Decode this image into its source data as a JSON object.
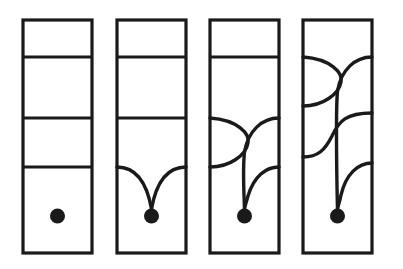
{
  "figure": {
    "background_color": "#ffffff",
    "ink_color": "#1a1a1a",
    "canvas": {
      "width": 403,
      "height": 269
    },
    "panel_count": 4,
    "panel_geometry": {
      "x_starts": [
        23,
        117,
        210,
        303
      ],
      "width": 69,
      "top": 20,
      "bottom": 253,
      "frame_stroke_width": 3.2
    },
    "levels": {
      "count": 3,
      "y_values": [
        57,
        118,
        167
      ],
      "labels": [
        "level-1",
        "level-2",
        "level-3"
      ],
      "stroke_width": 3.2
    },
    "marker": {
      "name": "basepoint-dot",
      "radius": 7.5,
      "y": 216,
      "color": "#1a1a1a"
    },
    "strand": {
      "stroke_width": 3.4,
      "color": "#1a1a1a"
    }
  },
  "panels": [
    {
      "index": 0,
      "name": "panel-1",
      "caption": "",
      "straight_levels": [
        57,
        118,
        167
      ],
      "resolved_levels": [],
      "has_dot": true,
      "dot_connected": false,
      "description": "Three horizontal chords; isolated basepoint below."
    },
    {
      "index": 1,
      "name": "panel-2",
      "caption": "",
      "straight_levels": [
        57,
        118
      ],
      "resolved_levels": [
        167
      ],
      "has_dot": true,
      "dot_connected": true,
      "description": "Lowest chord resolved into a pair of arcs meeting at the basepoint."
    },
    {
      "index": 2,
      "name": "panel-3",
      "caption": "",
      "straight_levels": [
        57
      ],
      "resolved_levels": [
        118,
        167
      ],
      "has_dot": true,
      "dot_connected": true,
      "description": "Two lowest chords resolved; strands cross once before reaching the basepoint."
    },
    {
      "index": 3,
      "name": "panel-4",
      "caption": "",
      "straight_levels": [],
      "resolved_levels": [
        57,
        118,
        167
      ],
      "has_dot": true,
      "dot_connected": true,
      "description": "All three chords resolved; strands cross twice before reaching the basepoint."
    }
  ],
  "chart_data": {
    "type": "diagram",
    "xlabel": "",
    "ylabel": "",
    "categories": [
      "panel-1",
      "panel-2",
      "panel-3",
      "panel-4"
    ],
    "values": [
      0,
      1,
      2,
      3
    ],
    "series": [
      {
        "name": "resolved-chords",
        "values": [
          0,
          1,
          2,
          3
        ]
      },
      {
        "name": "straight-chords",
        "values": [
          3,
          2,
          1,
          0
        ]
      }
    ],
    "annotations": [
      "Each successive panel resolves one more horizontal chord into arcs that descend to the basepoint dot.",
      "Level y-positions: 57, 118, 167 (top to bottom).",
      "Basepoint dot at y = 216 in every panel."
    ],
    "grid": false,
    "legend": "none"
  }
}
